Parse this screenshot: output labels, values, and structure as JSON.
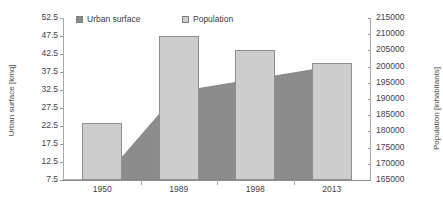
{
  "chart_data": {
    "type": "bar",
    "title": "",
    "categories": [
      "1950",
      "1989",
      "1998",
      "2013"
    ],
    "series": [
      {
        "name": "Urban surface",
        "type": "area",
        "axis": "left",
        "unit": "kmq",
        "values": [
          7.5,
          32.0,
          35.5,
          39.0
        ],
        "color": "#8c8c8c"
      },
      {
        "name": "Population",
        "type": "bar",
        "axis": "right",
        "unit": "inhabitants",
        "values": [
          182500,
          209300,
          205000,
          201000
        ],
        "color": "#cdcdcd"
      }
    ],
    "xlabel": "",
    "ylabel": "Urban surface [kmq]",
    "y2label": "Population [inhabitants]",
    "ylim": [
      7.5,
      52.5
    ],
    "ytick_step": 5,
    "y2lim": [
      165000,
      215000
    ],
    "y2tick_step": 5000,
    "yticks": [
      "52.5",
      "47.5",
      "42.5",
      "37.5",
      "32.5",
      "27.5",
      "22.5",
      "17.5",
      "12.5",
      "7.5"
    ],
    "y2ticks": [
      "215000",
      "210000",
      "205000",
      "200000",
      "195000",
      "190000",
      "185000",
      "180000",
      "175000",
      "170000",
      "165000"
    ],
    "grid": false,
    "legend_position": "top"
  },
  "legend": {
    "items": [
      {
        "label": "Urban surface",
        "swatch": "dark-swatch-icon",
        "color": "#8c8c8c"
      },
      {
        "label": "Population",
        "swatch": "light-swatch-icon",
        "color": "#cdcdcd"
      }
    ]
  },
  "axes": {
    "left_title": "Urban surface [kmq]",
    "right_title": "Population [inhabitants]"
  }
}
